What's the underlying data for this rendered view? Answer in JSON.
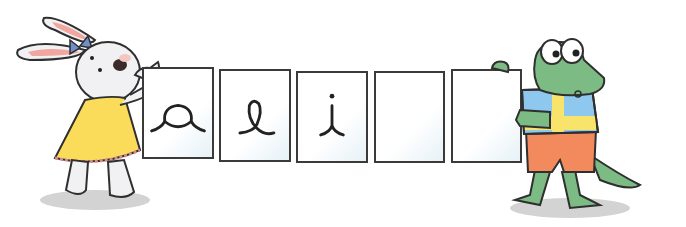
{
  "scene": {
    "description": "Bunny and crocodile holding a row of letter cards",
    "background": "#ffffff"
  },
  "cards": [
    {
      "letter": "a",
      "style": "cursive",
      "x": 142,
      "y": 67,
      "w": 72,
      "h": 92
    },
    {
      "letter": "e",
      "style": "cursive",
      "x": 219,
      "y": 69,
      "w": 72,
      "h": 93
    },
    {
      "letter": "i",
      "style": "cursive",
      "x": 296,
      "y": 71,
      "w": 72,
      "h": 92
    },
    {
      "letter": "",
      "style": "blank",
      "x": 374,
      "y": 71,
      "w": 71,
      "h": 92
    },
    {
      "letter": "",
      "style": "blank",
      "x": 451,
      "y": 69,
      "w": 71,
      "h": 94
    }
  ],
  "characters": {
    "bunny": {
      "name": "bunny",
      "dress_color": "#fbdc5a",
      "bow_color": "#6f8fc8",
      "fur_color": "#f1f1f3"
    },
    "crocodile": {
      "name": "crocodile",
      "skin_color": "#7dbb85",
      "shirt_colors": [
        "#8ec8ee",
        "#f8e46a"
      ],
      "shorts_color": "#f38a5e"
    }
  },
  "colors": {
    "outline": "#2f2f2f",
    "shadow": "#cfcfcf"
  }
}
